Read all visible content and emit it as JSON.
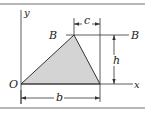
{
  "diagram": {
    "type": "triangle-area-geometry",
    "labels": {
      "y_axis": "y",
      "x_axis": "x",
      "origin": "O",
      "b": "b",
      "c": "c",
      "h": "h",
      "B_left": "B",
      "B_right": "B"
    },
    "colors": {
      "triangle_fill": "#d4d4d4",
      "line": "#333333",
      "border": "#9a9a9a"
    }
  }
}
